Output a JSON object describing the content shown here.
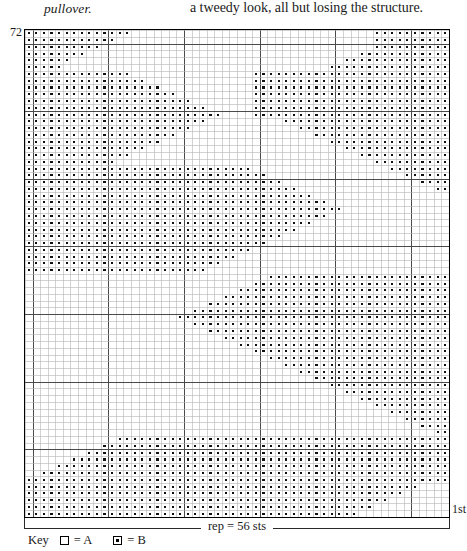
{
  "page": {
    "caption_left": "pullover.",
    "body_right": "a tweedy look, all but losing the structure."
  },
  "chart": {
    "top_row_label": "72",
    "bottom_row_label": "1st",
    "repeat_label": "rep = 56 sts",
    "key_word": "Key",
    "key_entries": [
      {
        "symbol": "empty-square",
        "text": "= A"
      },
      {
        "symbol": "dotted-square",
        "text": "= B"
      }
    ],
    "grid_line_color": "#b4b4b4",
    "border_color": "#000000",
    "symbol_color": "#111111"
  },
  "chart_data": {
    "type": "heatmap",
    "title": "rep = 56 sts",
    "xlabel": "",
    "ylabel": "",
    "cols": 56,
    "rows": 72,
    "legend": [
      "A",
      "B"
    ],
    "row_labels_shown": {
      "top": "72",
      "bottom": "1st"
    },
    "heavy_gridline_cols": [
      1,
      11,
      21,
      31,
      41,
      51
    ],
    "heavy_gridline_rows_from_top": [
      2,
      12,
      22,
      32,
      42,
      52,
      62
    ],
    "matrix": [
      "11111111111111000000000000000000000000000000001111111111",
      "11111111111100000000000000000000000000000000001111111111",
      "11111111110000000000000000000000000000000000001111111111",
      "11111111000000000000000000000000000000000000111111111111",
      "11111100000000000000000000000000000000000011111111111111",
      "11111000000000000000000000000000000000001111111111111111",
      "11111111111111000000000000000011111111111111111111111111",
      "11111111111111110000000000000011111111111111111111111111",
      "11111111111111111100000000000011111111111111111111111111",
      "11111111111111111111000000000011111111111111111111111111",
      "11111111111111111111110000000011111111111111111111111111",
      "11111111111111111111111100000011111111111111111111111111",
      "11111111111111111111111111000011111111111111111111111111",
      "11111111111111111111111100000000001111111111111111111111",
      "11111111111111111111110000000000000011111111111111111111",
      "11111111111111111111000000000000000000111111111111111111",
      "11111111111111111100000000000000000000001111111111111111",
      "11111111111111110000000000000000000000000011111111111111",
      "11111111111111000000000000000000000000000000111111111111",
      "11111111111100000000000000000000000000000000001111111111",
      "11111111111111111111111111111100000000000000000011111111",
      "11111111111111111111111111111111000000000000000000111111",
      "11111111111111111111111111111111110000000000000000001111",
      "11111111111111111111111111111111111100000000000000000011",
      "11111111111111111111111111111111111111000000000000000000",
      "11111111111111111111111111111111111111110000000000000000",
      "11111111111111111111111111111111111111111100000000000000",
      "11111111111111111111111111111111111111110000000000000000",
      "11111111111111111111111111111111111111000000000000000000",
      "11111111111111111111111111111111111100000000000000000000",
      "11111111111111111111111111111111110000000000000000000000",
      "11111111111111111111111111111111000000000000000000000000",
      "11111111111111111111111111111100000000000000000000000000",
      "11111111111111111111111111110000000000000000000000000000",
      "11111111111111111111111111000000000000000000000000000000",
      "11111111111111111111111100000000000000000000000000000000",
      "00000000000000000000000000000000111111111111111111111111",
      "00000000000000000000000000000011111111111111111111111111",
      "00000000000000000000000000001111111111111111111111111111",
      "00000000000000000000000000111111111111111111111111111111",
      "00000000000000000000000011111111111111111111111111111111",
      "00000000000000000000001111111111111111111111111111111111",
      "00000000000000000000111111111111111111111111111111111111",
      "00000000000000000000001111111111111111111111111111111111",
      "00000000000000000000000011111111111111111111111111111111",
      "00000000000000000000000000111111111111111111111111111111",
      "00000000000000000000000000001111111111111111111111111111",
      "00000000000000000000000000000011111111111111111111111111",
      "00000000000000000000000000000000111111111111111111111111",
      "00000000000000000000000000000000001111111111111111111111",
      "00000000000000000000000000000000000011111111111111111111",
      "00000000000000000000000000000000000000111111111111111111",
      "00000000000000000000000000000000000000001111111111111111",
      "00000000000000000000000000000000000000000011111111111111",
      "00000000000000000000000000000000000000000000111111111111",
      "00000000000000000000000000000000000000000000001111111111",
      "00000000000000000000000000000000000000000000000011111111",
      "00000000000000000000000000000000000000000000000000111111",
      "00000000000000000000000000000000000000000000000000001111",
      "00000000000000000000000000000000000000000000000000000011",
      "00000000000011111111111111111111111111111111111111111111",
      "00000000001111111111111111111111111111111111111111111111",
      "00000000111111111111111111111111111111111111111111111111",
      "00000011111111111111111111111111111111111111111111111111",
      "00001111111111111111111111111111111111111111111111111111",
      "00111111111111111111111111111111111111111111111111111111",
      "11111111111111111111111111111111111111111111111111111111",
      "11111111111111111111111111111111111111111111111111110000",
      "11111111111111111111111111111111111111111111111111000000",
      "11111111111111111111111111111111111111111111111100000000",
      "11111111111111111111111111111111111111111111110000000000",
      "11111111111111111111111111111111111111111111000000000000"
    ]
  }
}
